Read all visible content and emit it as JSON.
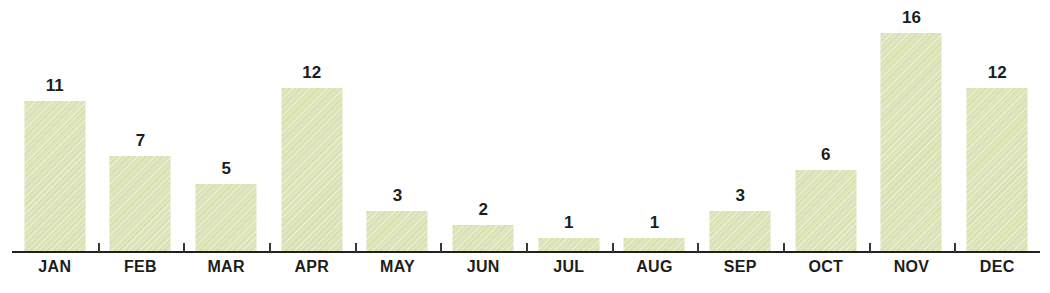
{
  "chart_data": {
    "type": "bar",
    "title": "",
    "subtitle": "",
    "xlabel": "",
    "ylabel": "",
    "categories": [
      "JAN",
      "FEB",
      "MAR",
      "APR",
      "MAY",
      "JUN",
      "JUL",
      "AUG",
      "SEP",
      "OCT",
      "NOV",
      "DEC"
    ],
    "values": [
      11,
      7,
      5,
      12,
      3,
      2,
      1,
      1,
      3,
      6,
      16,
      12
    ],
    "value_labels": [
      "11",
      "7",
      "5",
      "12",
      "3",
      "2",
      "1",
      "1",
      "3",
      "6",
      "16",
      "12"
    ],
    "ylim": [
      0,
      16
    ],
    "grid": false,
    "legend": false,
    "legend_position": "none",
    "axis": {
      "x_axis_visible": true,
      "y_axis_visible": false,
      "tick_marks": true
    },
    "colors": {
      "bar_fill": "#dde4b8",
      "bar_texture": "#bac68c",
      "axis_line": "#231f1d",
      "tick": "#3a3632",
      "label_text": "#1d1d1b",
      "value_text": "#1d1d1b",
      "background": "#ffffff"
    }
  }
}
